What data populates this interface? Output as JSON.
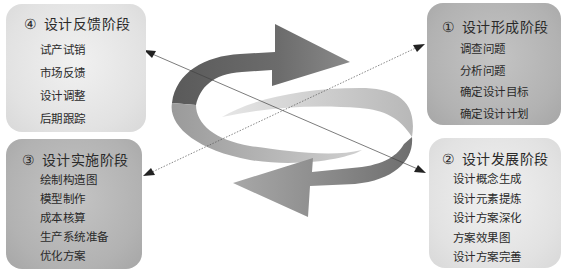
{
  "diagram": {
    "type": "cyclic-process",
    "stages": [
      {
        "id": "stage-1",
        "number": "①",
        "title": "设计形成阶段",
        "position": "top-right",
        "items": [
          "调查问题",
          "分析问题",
          "确定设计目标",
          "确定设计计划"
        ]
      },
      {
        "id": "stage-2",
        "number": "②",
        "title": "设计发展阶段",
        "position": "bottom-right",
        "items": [
          "设计概念生成",
          "设计元素提炼",
          "设计方案深化",
          "方案效果图",
          "设计方案完善"
        ]
      },
      {
        "id": "stage-3",
        "number": "③",
        "title": "设计实施阶段",
        "position": "bottom-left",
        "items": [
          "绘制构造图",
          "模型制作",
          "成本核算",
          "生产系统准备",
          "优化方案"
        ]
      },
      {
        "id": "stage-4",
        "number": "④",
        "title": "设计反馈阶段",
        "position": "top-left",
        "items": [
          "试产试销",
          "市场反馈",
          "设计调整",
          "后期跟踪"
        ]
      }
    ],
    "center_graphic": "circular-double-arrow-icon",
    "connectors": [
      {
        "from": "stage-3",
        "to": "stage-1",
        "style": "dotted-arrow"
      },
      {
        "from": "stage-4",
        "to": "stage-2",
        "style": "dotted-arrow-bidirectional"
      }
    ],
    "colors": {
      "light_box": "#e2e2e2",
      "dark_box": "#b2b2b2",
      "arrow_dark": "#6a6a6a",
      "arrow_light": "#c8c8c8",
      "text": "#2a2a2a"
    }
  }
}
